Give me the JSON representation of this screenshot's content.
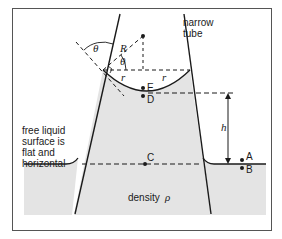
{
  "diagram": {
    "type": "physics-capillary-rise",
    "colors": {
      "frame": "#555555",
      "liquid_fill": "#e4e4e4",
      "line": "#1a1a1a",
      "background": "#ffffff"
    },
    "labels": {
      "tube": [
        "narrow",
        "tube"
      ],
      "free_surface": [
        "free liquid",
        "surface is",
        "flat and",
        "horizontal"
      ],
      "density": "density",
      "density_symbol": "ρ",
      "theta_outer": "θ",
      "theta_inner": "θ",
      "radius_R": "R",
      "radius_r_left": "r",
      "radius_r_right": "r",
      "point_E": "E",
      "point_D": "D",
      "point_C": "C",
      "point_A": "A",
      "point_B": "B",
      "height_h": "h"
    }
  }
}
